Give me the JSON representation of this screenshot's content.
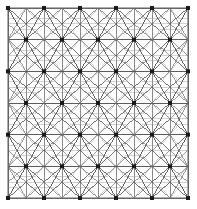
{
  "figure": {
    "kind": "mesh-diagram",
    "background_color": "#ffffff"
  },
  "canvas": {
    "width": 197,
    "height": 209
  },
  "domain": {
    "name": "square-domain-boundary",
    "x_min": 8,
    "y_min": 8,
    "x_max": 188,
    "y_max": 198,
    "width": 180,
    "height": 190,
    "stroke_color": "#6e6e6e",
    "stroke_width": 1.1,
    "fill": "none"
  },
  "mesh": {
    "line_color": "#5a5a5a",
    "line_color_light": "#9a9a9a",
    "line_width_main": 0.6,
    "line_width_thin": 0.45,
    "horizontal_band_color": "#555555",
    "horizontal_band_width": 0.9,
    "rosette_spoke_count": 12,
    "pattern": "staggered hexagonal rosettes with full triangulation"
  },
  "nodes": {
    "name": "major-nodes",
    "marker_shape": "square",
    "marker_size": 4,
    "marker_color": "#1a1a1a",
    "columns_per_row": 6,
    "rows": 7,
    "row_spacing": 27.1,
    "column_spacing": 36.0,
    "stagger_offset": 18.0,
    "first_row_y": 8,
    "first_col_x": 8,
    "count_total": 45
  },
  "legend": {
    "visible": false,
    "entries": []
  },
  "labels": {
    "visible": false,
    "axis_x": "",
    "axis_y": "",
    "caption": ""
  }
}
